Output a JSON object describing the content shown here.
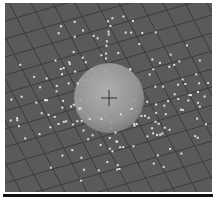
{
  "scene": {
    "type": "3d-viewport",
    "background_color": "#5a5a5a",
    "grid_line_color": "#3c3c3c",
    "sphere": {
      "cx": 104,
      "cy": 95,
      "r": 35,
      "color": "#a8a8a8"
    },
    "particle_color": "#e0e0e0",
    "particle_count": 180
  },
  "bottom_bar": {
    "color": "#111111"
  }
}
